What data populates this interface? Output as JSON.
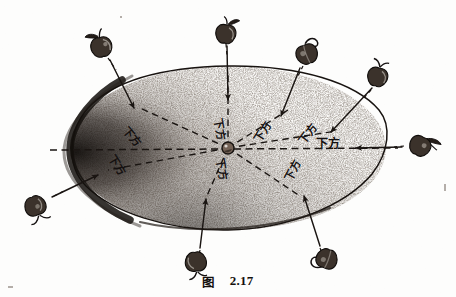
{
  "figure": {
    "caption_label": "图",
    "caption_number": "2.17",
    "title_text": "图 2.17",
    "medium": "scanned-halftone-line-drawing",
    "background_color": "#fdfdfc",
    "ink_color": "#1a1512",
    "paper_tone": "#f4f1ec"
  },
  "body": {
    "name": "earth-ellipse",
    "shape": "ellipse",
    "center_x": 228,
    "center_y": 148,
    "radius_x": 158,
    "radius_y": 82,
    "fill_texture": "stipple",
    "stipple_color": "#3a322c",
    "outline_color": "#181310",
    "shadow_edge": "left",
    "shadow_color": "#100d0b"
  },
  "center_marker": {
    "name": "earth-center-dot",
    "x": 228,
    "y": 148,
    "radius": 5.5,
    "fill": "#2a231e"
  },
  "axes": [
    {
      "name": "horizontal-dashed-axis",
      "x1": 48,
      "y1": 150,
      "x2": 400,
      "y2": 148,
      "style": "dashed"
    }
  ],
  "label_text": "下方",
  "radials": [
    {
      "id": "r-nw",
      "name": "radial-northwest",
      "angle_deg": 218,
      "label": "下方",
      "label_rotation": 38,
      "apple_x": 101,
      "apple_y": 45,
      "arrow_tip_x": 133,
      "arrow_tip_y": 108,
      "dash_inner_x": 161,
      "dash_inner_y": 135
    },
    {
      "id": "r-n",
      "name": "radial-north",
      "angle_deg": 270,
      "label": "下方",
      "label_rotation": 88,
      "apple_x": 226,
      "apple_y": 32,
      "arrow_tip_x": 228,
      "arrow_tip_y": 100,
      "dash_inner_x": 228,
      "dash_inner_y": 143
    },
    {
      "id": "r-ne",
      "name": "radial-northeast",
      "angle_deg": 318,
      "label": "下方",
      "label_rotation": -42,
      "apple_x": 306,
      "apple_y": 52,
      "arrow_tip_x": 283,
      "arrow_tip_y": 116,
      "dash_inner_x": 262,
      "dash_inner_y": 140
    },
    {
      "id": "r-ene",
      "name": "radial-east-northeast",
      "angle_deg": 337,
      "label": "下方",
      "label_rotation": -33,
      "apple_x": 378,
      "apple_y": 75,
      "arrow_tip_x": 330,
      "arrow_tip_y": 133,
      "dash_inner_x": 306,
      "dash_inner_y": 142
    },
    {
      "id": "r-e",
      "name": "radial-east",
      "angle_deg": 0,
      "label": "下方",
      "label_rotation": 0,
      "apple_x": 421,
      "apple_y": 144,
      "arrow_tip_x": 352,
      "arrow_tip_y": 148,
      "dash_inner_x": 318,
      "dash_inner_y": 148
    },
    {
      "id": "r-w",
      "name": "radial-west",
      "angle_deg": 152,
      "label": "下方",
      "label_rotation": 58,
      "apple_x": 36,
      "apple_y": 208,
      "arrow_tip_x": 96,
      "arrow_tip_y": 176,
      "dash_inner_x": 126,
      "dash_inner_y": 160
    },
    {
      "id": "r-s",
      "name": "radial-south",
      "angle_deg": 92,
      "label": "下方",
      "label_rotation": 82,
      "apple_x": 196,
      "apple_y": 264,
      "arrow_tip_x": 205,
      "arrow_tip_y": 196,
      "dash_inner_x": 214,
      "dash_inner_y": 158
    },
    {
      "id": "r-se",
      "name": "radial-southeast",
      "angle_deg": 62,
      "label": "下方",
      "label_rotation": -70,
      "apple_x": 326,
      "apple_y": 261,
      "arrow_tip_x": 306,
      "arrow_tip_y": 194,
      "dash_inner_x": 293,
      "dash_inner_y": 158
    }
  ],
  "apples": [
    {
      "id": "a-nw",
      "name": "apple-northwest",
      "x": 101,
      "y": 45,
      "size": 20,
      "rotation": -12,
      "stem": "leaf-up"
    },
    {
      "id": "a-n",
      "name": "apple-north",
      "x": 226,
      "y": 32,
      "size": 19,
      "rotation": 8,
      "stem": "leaf-up"
    },
    {
      "id": "a-ne",
      "name": "apple-northeast",
      "x": 306,
      "y": 52,
      "size": 21,
      "rotation": -20,
      "stem": "hook-right"
    },
    {
      "id": "a-ene",
      "name": "apple-east-northeast",
      "x": 378,
      "y": 75,
      "size": 19,
      "rotation": 14,
      "stem": "leaf-up"
    },
    {
      "id": "a-e",
      "name": "apple-east",
      "x": 421,
      "y": 144,
      "size": 20,
      "rotation": 28,
      "stem": "leaf-right"
    },
    {
      "id": "a-w",
      "name": "apple-west",
      "x": 36,
      "y": 208,
      "size": 20,
      "rotation": 160,
      "stem": "leaf-down"
    },
    {
      "id": "a-s",
      "name": "apple-south",
      "x": 196,
      "y": 264,
      "size": 20,
      "rotation": 175,
      "stem": "leaf-down"
    },
    {
      "id": "a-se",
      "name": "apple-southeast",
      "x": 326,
      "y": 261,
      "size": 20,
      "rotation": 200,
      "stem": "hook-right"
    }
  ]
}
